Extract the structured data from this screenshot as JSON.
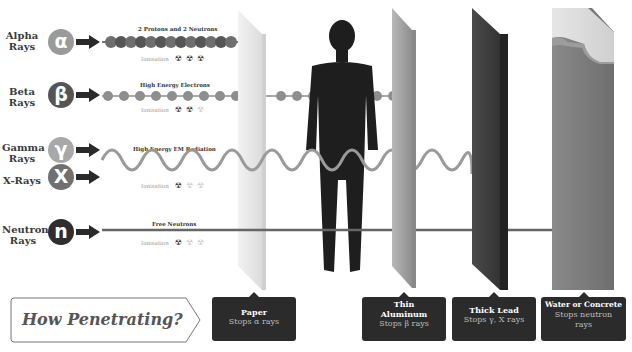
{
  "rays": [
    {
      "id": "alpha",
      "label": "Alpha\nRays",
      "symbol": "α",
      "color": "#9a9a9a",
      "caption": "2 Protons and 2 Neutrons",
      "ionisation_label": "Ionisation",
      "ionisation_level": 3
    },
    {
      "id": "beta",
      "label": "Beta\nRays",
      "symbol": "β",
      "color": "#555555",
      "caption": "High Energy Electrons",
      "ionisation_label": "Ionisation",
      "ionisation_level": 2
    },
    {
      "id": "gamma",
      "label": "Gamma\nRays",
      "symbol": "γ",
      "color": "#a8a8a8",
      "caption": "High Energy EM Radiation",
      "ionisation_label": "Ionisation",
      "ionisation_level": 1
    },
    {
      "id": "xray",
      "label": "X-Rays",
      "symbol": "X",
      "color": "#707070"
    },
    {
      "id": "neutron",
      "label": "Neutron\nRays",
      "symbol": "n",
      "color": "#2e2e2e",
      "caption": "Free Neutrons",
      "ionisation_label": "Ionisation",
      "ionisation_level": 1
    }
  ],
  "ionisation_icon": "☢",
  "barriers": [
    {
      "id": "paper",
      "title": "Paper",
      "sub": "Stops α rays",
      "color": "#e4e4e4"
    },
    {
      "id": "aluminum",
      "title": "Thin Aluminum",
      "sub": "Stops β rays",
      "color": "#9c9c9c"
    },
    {
      "id": "lead",
      "title": "Thick Lead",
      "sub": "Stops γ, X rays",
      "color": "#3c3c3c"
    },
    {
      "id": "concrete",
      "title": "Water or Concrete",
      "sub": "Stops neutron rays",
      "color": "#8a8a8a"
    }
  ],
  "question": "How Penetrating?"
}
